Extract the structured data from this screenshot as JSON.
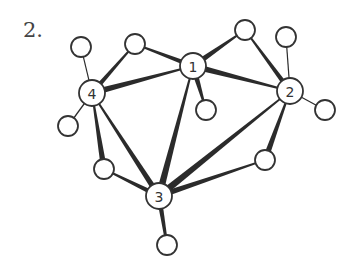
{
  "figure": {
    "label": "2.",
    "stroke_color": "#333333",
    "fill_color": "#ffffff"
  },
  "nodes": [
    {
      "id": "1",
      "label": "1",
      "x": 193,
      "y": 66,
      "r": 13
    },
    {
      "id": "2",
      "label": "2",
      "x": 290,
      "y": 91,
      "r": 13
    },
    {
      "id": "3",
      "label": "3",
      "x": 159,
      "y": 196,
      "r": 13
    },
    {
      "id": "4",
      "label": "4",
      "x": 92,
      "y": 93,
      "r": 13
    },
    {
      "id": "a",
      "label": "",
      "x": 81,
      "y": 47,
      "r": 10
    },
    {
      "id": "b",
      "label": "",
      "x": 135,
      "y": 44,
      "r": 10
    },
    {
      "id": "c",
      "label": "",
      "x": 245,
      "y": 30,
      "r": 10
    },
    {
      "id": "d",
      "label": "",
      "x": 286,
      "y": 37,
      "r": 10
    },
    {
      "id": "e",
      "label": "",
      "x": 206,
      "y": 110,
      "r": 10
    },
    {
      "id": "f",
      "label": "",
      "x": 325,
      "y": 110,
      "r": 10
    },
    {
      "id": "g",
      "label": "",
      "x": 68,
      "y": 126,
      "r": 10
    },
    {
      "id": "h",
      "label": "",
      "x": 104,
      "y": 169,
      "r": 10
    },
    {
      "id": "i",
      "label": "",
      "x": 265,
      "y": 160,
      "r": 10
    },
    {
      "id": "j",
      "label": "",
      "x": 167,
      "y": 245,
      "r": 10
    }
  ],
  "edges": [
    {
      "from": "4",
      "to": "a",
      "w1": 1.2,
      "w2": 1.2
    },
    {
      "from": "4",
      "to": "b",
      "w1": 5,
      "w2": 1.5
    },
    {
      "from": "b",
      "to": "1",
      "w1": 1.5,
      "w2": 5
    },
    {
      "from": "4",
      "to": "1",
      "w1": 6,
      "w2": 1.5
    },
    {
      "from": "1",
      "to": "c",
      "w1": 6,
      "w2": 1.5
    },
    {
      "from": "c",
      "to": "2",
      "w1": 1.5,
      "w2": 5
    },
    {
      "from": "1",
      "to": "2",
      "w1": 6,
      "w2": 1.5
    },
    {
      "from": "1",
      "to": "e",
      "w1": 6,
      "w2": 1.5
    },
    {
      "from": "1",
      "to": "3",
      "w1": 1.5,
      "w2": 7
    },
    {
      "from": "2",
      "to": "d",
      "w1": 1.2,
      "w2": 1.2
    },
    {
      "from": "2",
      "to": "f",
      "w1": 1.2,
      "w2": 1.2
    },
    {
      "from": "2",
      "to": "3",
      "w1": 1.5,
      "w2": 7
    },
    {
      "from": "2",
      "to": "i",
      "w1": 1.5,
      "w2": 6
    },
    {
      "from": "i",
      "to": "3",
      "w1": 1.5,
      "w2": 6
    },
    {
      "from": "4",
      "to": "g",
      "w1": 1.2,
      "w2": 1.2
    },
    {
      "from": "4",
      "to": "h",
      "w1": 1.5,
      "w2": 6
    },
    {
      "from": "4",
      "to": "3",
      "w1": 1.5,
      "w2": 6
    },
    {
      "from": "h",
      "to": "3",
      "w1": 1.5,
      "w2": 5
    },
    {
      "from": "3",
      "to": "j",
      "w1": 5,
      "w2": 2.5
    }
  ]
}
